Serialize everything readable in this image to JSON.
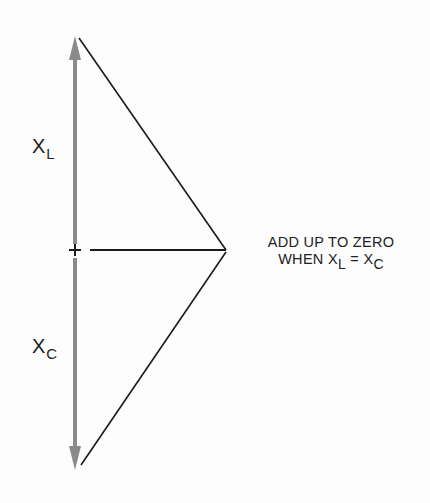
{
  "diagram": {
    "labels": {
      "xl": {
        "main": "X",
        "sub": "L"
      },
      "xc": {
        "main": "X",
        "sub": "C"
      }
    },
    "note": {
      "line1": "ADD UP TO ZERO",
      "line2_prefix": "WHEN X",
      "line2_sub1": "L",
      "line2_eq": " = X",
      "line2_sub2": "C"
    },
    "colors": {
      "arrow": "#8a8a8a",
      "line": "#1a1a1a",
      "background": "#fdfdfd"
    },
    "markers": {
      "origin": "+"
    }
  }
}
